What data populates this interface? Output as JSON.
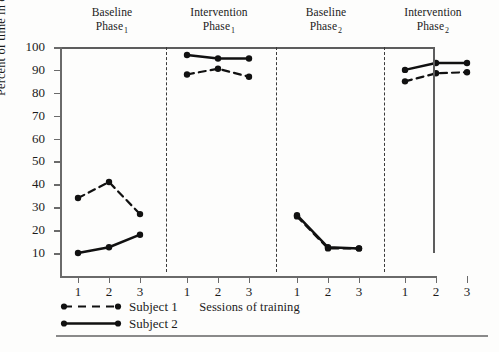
{
  "chart_data": {
    "type": "line",
    "title": "",
    "xlabel": "Sessions of training",
    "ylabel": "Percent of time in changeover",
    "ylim": [
      0,
      100
    ],
    "yticks": [
      10,
      20,
      30,
      40,
      50,
      60,
      70,
      80,
      90,
      100
    ],
    "ytick_labels": [
      "10",
      "20",
      "30",
      "40",
      "50",
      "60",
      "70",
      "80",
      "90",
      "100"
    ],
    "grid": false,
    "legend_position": "bottom-left",
    "phase_separators": true,
    "phases": [
      {
        "name": "Baseline",
        "phase_number": "1",
        "line1": "Baseline",
        "line2": "Phase",
        "sub": "1",
        "sessions": [
          "1",
          "2",
          "3"
        ]
      },
      {
        "name": "Intervention",
        "phase_number": "1",
        "line1": "Intervention",
        "line2": "Phase",
        "sub": "1",
        "sessions": [
          "1",
          "2",
          "3"
        ]
      },
      {
        "name": "Baseline",
        "phase_number": "2",
        "line1": "Baseline",
        "line2": "Phase",
        "sub": "2",
        "sessions": [
          "1",
          "2",
          "3"
        ]
      },
      {
        "name": "Intervention",
        "phase_number": "2",
        "line1": "Intervention",
        "line2": "Phase",
        "sub": "2",
        "sessions": [
          "1",
          "2",
          "3"
        ]
      }
    ],
    "categories": [
      "1",
      "2",
      "3",
      "1",
      "2",
      "3",
      "1",
      "2",
      "3",
      "1",
      "2",
      "3"
    ],
    "series": [
      {
        "name": "Subject 1",
        "style": "dashed",
        "marker": "circle",
        "color": "#111111",
        "segments": [
          {
            "phase": "Baseline Phase 1",
            "values": [
              34,
              41,
              27
            ]
          },
          {
            "phase": "Intervention Phase 1",
            "values": [
              88,
              90.5,
              87
            ]
          },
          {
            "phase": "Baseline Phase 2",
            "values": [
              26,
              12,
              12
            ]
          },
          {
            "phase": "Intervention Phase 2",
            "values": [
              85,
              88.5,
              89
            ]
          }
        ],
        "values": [
          34,
          41,
          27,
          88,
          90.5,
          87,
          26,
          12,
          12,
          85,
          88.5,
          89
        ]
      },
      {
        "name": "Subject 2",
        "style": "solid",
        "marker": "circle",
        "color": "#111111",
        "segments": [
          {
            "phase": "Baseline Phase 1",
            "values": [
              10,
              12.5,
              18
            ]
          },
          {
            "phase": "Intervention Phase 1",
            "values": [
              96.5,
              95,
              95
            ]
          },
          {
            "phase": "Baseline Phase 2",
            "values": [
              26.5,
              12.5,
              12
            ]
          },
          {
            "phase": "Intervention Phase 2",
            "values": [
              90,
              93,
              93
            ]
          }
        ],
        "values": [
          10,
          12.5,
          18,
          96.5,
          95,
          95,
          26.5,
          12.5,
          12,
          90,
          93,
          93
        ]
      }
    ]
  },
  "legend": {
    "entries": [
      {
        "label": "Subject 1",
        "style": "dashed"
      },
      {
        "label": "Subject 2",
        "style": "solid"
      }
    ]
  }
}
